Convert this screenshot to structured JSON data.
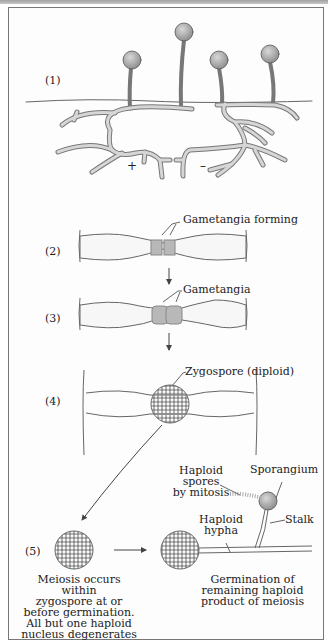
{
  "figure": {
    "stages": [
      {
        "label": "(1)"
      },
      {
        "label": "(2)"
      },
      {
        "label": "(3)"
      },
      {
        "label": "(4)"
      },
      {
        "label": "(5)"
      }
    ],
    "mating_types": {
      "plus": "+",
      "minus": "–"
    },
    "annotations": {
      "gametangia_forming": "Gametangia forming",
      "gametangia": "Gametangia",
      "zygospore": "Zygospore (diploid)",
      "haploid_spores_line1": "Haploid spores",
      "haploid_spores_line2": "by mitosis",
      "sporangium": "Sporangium",
      "haploid_hypha_line1": "Haploid",
      "haploid_hypha_line2": "hypha",
      "stalk": "Stalk"
    },
    "captions": {
      "meiosis": [
        "Meiosis occurs within",
        "zygospore at or",
        "before germination.",
        "All but one haploid",
        "nucleus degenerates"
      ],
      "germination": [
        "Germination of",
        "remaining haploid",
        "product of meiosis"
      ]
    },
    "colors": {
      "line": "#555555",
      "fill_hypha": "#d6d6d6",
      "gametangia": "#b8b8b8",
      "sporangium": "#aaaaaa"
    }
  }
}
